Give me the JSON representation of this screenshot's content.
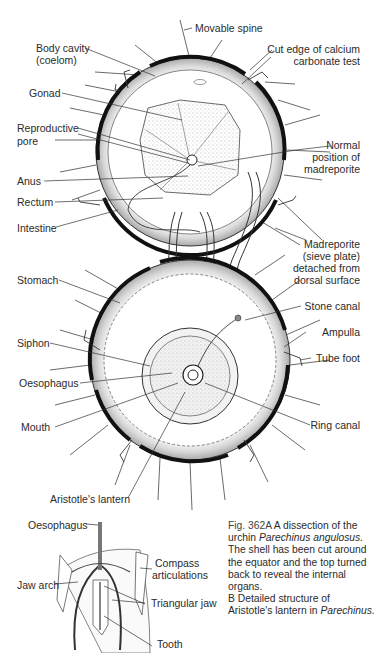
{
  "figure": {
    "id": "Fig. 362A",
    "part_a_subject": "Dissection of sea urchin Parechinus angulosus",
    "part_b_subject": "Aristotle's lantern in Parechinus"
  },
  "labels_a": {
    "movable_spine": "Movable spine",
    "body_cavity_1": "Body cavity",
    "body_cavity_2": "(coelom)",
    "cut_edge_1": "Cut edge of calcium",
    "cut_edge_2": "carbonate test",
    "gonad": "Gonad",
    "reproductive_pore_1": "Reproductive",
    "reproductive_pore_2": "pore",
    "normal_position_1": "Normal",
    "normal_position_2": "position of",
    "normal_position_3": "madreporite",
    "anus": "Anus",
    "rectum": "Rectum",
    "intestine": "Intestine",
    "madreporite_1": "Madreporite",
    "madreporite_2": "(sieve plate)",
    "madreporite_3": "detached from",
    "madreporite_4": "dorsal surface",
    "stomach": "Stomach",
    "stone_canal": "Stone canal",
    "ampulla": "Ampulla",
    "siphon": "Siphon",
    "tube_foot": "Tube foot",
    "oesophagus": "Oesophagus",
    "mouth": "Mouth",
    "ring_canal": "Ring canal",
    "aristotles_lantern": "Aristotle's lantern"
  },
  "labels_b": {
    "oesophagus": "Oesophagus",
    "compass_1": "Compass",
    "compass_2": "articulations",
    "jaw_arch": "Jaw arch",
    "triangular_jaw": "Triangular jaw",
    "tooth": "Tooth"
  },
  "caption": {
    "figno": "Fig. 362A",
    "text1": " A dissection of the urchin ",
    "species1": "Parechinus angulosus.",
    "text2": " The shell has been cut around the equator and the top turned back to reveal the internal organs.",
    "part_b": "B",
    "text3": " Detailed structure of Aristotle's lantern in ",
    "species2": "Parechinus."
  },
  "colors": {
    "ink": "#1a1a1a",
    "shade": "#b8b8b8",
    "text": "#2b2b2b",
    "background": "#ffffff"
  }
}
